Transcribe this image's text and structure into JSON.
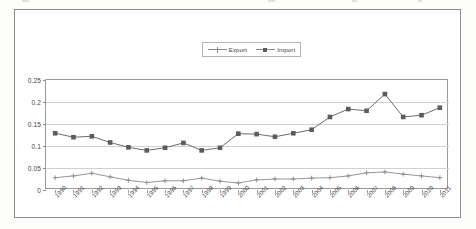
{
  "chart_data": {
    "type": "line",
    "title": "",
    "xlabel": "",
    "ylabel": "",
    "ylim": [
      0,
      0.25
    ],
    "yticks": [
      "0",
      "0.05",
      "0.1",
      "0.15",
      "0.2",
      "0.25"
    ],
    "ytick_values": [
      0,
      0.05,
      0.1,
      0.15,
      0.2,
      0.25
    ],
    "grid": true,
    "legend_position": "top-center",
    "categories": [
      "1990",
      "1991",
      "1992",
      "1993",
      "1994",
      "1995",
      "1996",
      "1997",
      "1998",
      "1999",
      "2000",
      "2001",
      "2002",
      "2003",
      "2004",
      "2005",
      "2006",
      "2007",
      "2008",
      "2009",
      "2010",
      "2011"
    ],
    "series": [
      {
        "name": "Export",
        "marker": "plus",
        "color": "#8a8a8a",
        "values": [
          0.028,
          0.032,
          0.038,
          0.03,
          0.022,
          0.017,
          0.021,
          0.021,
          0.027,
          0.02,
          0.016,
          0.023,
          0.025,
          0.025,
          0.027,
          0.028,
          0.032,
          0.039,
          0.041,
          0.036,
          0.032,
          0.028
        ]
      },
      {
        "name": "Import",
        "marker": "square",
        "color": "#5c5c5c",
        "values": [
          0.129,
          0.12,
          0.122,
          0.108,
          0.097,
          0.09,
          0.096,
          0.107,
          0.09,
          0.096,
          0.128,
          0.127,
          0.121,
          0.129,
          0.137,
          0.166,
          0.184,
          0.18,
          0.218,
          0.166,
          0.17,
          0.187
        ]
      }
    ]
  },
  "legend": {
    "entries": [
      {
        "label": "Export"
      },
      {
        "label": "Import"
      }
    ]
  }
}
